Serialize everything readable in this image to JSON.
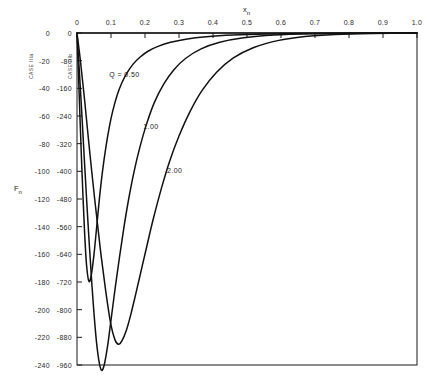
{
  "chart_data": {
    "type": "line",
    "title": "",
    "xlabel": "x_n",
    "ylabel": "F_n",
    "x_axis_position": "top",
    "xlim": [
      0,
      1.0
    ],
    "x_ticks": [
      "0",
      "0.1",
      "0.2",
      "0.3",
      "0.4",
      "0.5",
      "0.6",
      "0.7",
      "0.8",
      "0.9",
      "1.0"
    ],
    "x_tick_values": [
      0,
      0.1,
      0.2,
      0.3,
      0.4,
      0.5,
      0.6,
      0.7,
      0.8,
      0.9,
      1.0
    ],
    "grid": false,
    "legend_position": "inline-annotations",
    "axes": [
      {
        "name": "outer",
        "case_label": "CASE IIIa",
        "ylim": [
          -240,
          0
        ],
        "ticks": [
          "0",
          "-20",
          "-40",
          "-60",
          "-80",
          "-100",
          "-120",
          "-140",
          "-160",
          "-180",
          "-200",
          "-220",
          "-240"
        ],
        "tick_values": [
          0,
          -20,
          -40,
          -60,
          -80,
          -100,
          -120,
          -140,
          -160,
          -180,
          -200,
          -220,
          -240
        ]
      },
      {
        "name": "inner",
        "case_label": "CASE IIIb",
        "ylim": [
          -960,
          0
        ],
        "ticks": [
          "0",
          "-80",
          "-160",
          "-240",
          "-320",
          "-400",
          "-480",
          "-560",
          "-640",
          "-720",
          "-800",
          "-880",
          "-960"
        ],
        "tick_values": [
          0,
          -80,
          -160,
          -240,
          -320,
          -400,
          -480,
          -560,
          -640,
          -720,
          -800,
          -880,
          -960
        ]
      }
    ],
    "series": [
      {
        "name": "Q = 0.50",
        "label": "Q = 0.50",
        "q_value": 0.5,
        "minimum_x": 0.035,
        "minimum_y": -720,
        "points_x": [
          0.0,
          0.004,
          0.009,
          0.015,
          0.022,
          0.028,
          0.035,
          0.042,
          0.05,
          0.058,
          0.066,
          0.075,
          0.085,
          0.095,
          0.105,
          0.118,
          0.132,
          0.148,
          0.165,
          0.185,
          0.21,
          0.24,
          0.275,
          0.32,
          0.38,
          0.46,
          0.56,
          0.68,
          0.82,
          1.0
        ],
        "points_y": [
          0,
          -110,
          -250,
          -410,
          -570,
          -670,
          -718,
          -700,
          -640,
          -560,
          -478,
          -400,
          -330,
          -272,
          -226,
          -180,
          -144,
          -114,
          -90,
          -70,
          -52,
          -38,
          -27,
          -18,
          -11,
          -6,
          -3,
          -1.5,
          -0.6,
          0
        ]
      },
      {
        "name": "1.00",
        "label": "1.00",
        "q_value": 1.0,
        "minimum_x": 0.072,
        "minimum_y": -975,
        "points_x": [
          0.0,
          0.006,
          0.014,
          0.023,
          0.033,
          0.044,
          0.055,
          0.064,
          0.072,
          0.08,
          0.09,
          0.1,
          0.112,
          0.125,
          0.138,
          0.152,
          0.168,
          0.185,
          0.205,
          0.228,
          0.255,
          0.285,
          0.32,
          0.365,
          0.42,
          0.49,
          0.58,
          0.69,
          0.83,
          1.0
        ],
        "points_y": [
          0,
          -95,
          -230,
          -390,
          -560,
          -730,
          -870,
          -945,
          -975,
          -960,
          -905,
          -830,
          -740,
          -648,
          -562,
          -480,
          -400,
          -330,
          -262,
          -200,
          -148,
          -106,
          -73,
          -46,
          -27,
          -14,
          -6,
          -2.5,
          -0.8,
          0
        ]
      },
      {
        "name": "2.00",
        "label": "2.00",
        "q_value": 2.0,
        "minimum_x": 0.122,
        "minimum_y": -900,
        "points_x": [
          0.0,
          0.01,
          0.022,
          0.036,
          0.052,
          0.068,
          0.085,
          0.1,
          0.112,
          0.122,
          0.132,
          0.145,
          0.158,
          0.172,
          0.188,
          0.205,
          0.225,
          0.248,
          0.272,
          0.3,
          0.332,
          0.368,
          0.41,
          0.46,
          0.52,
          0.59,
          0.67,
          0.76,
          0.87,
          1.0
        ],
        "points_y": [
          0,
          -80,
          -190,
          -330,
          -480,
          -620,
          -750,
          -845,
          -888,
          -900,
          -890,
          -860,
          -815,
          -758,
          -690,
          -618,
          -535,
          -450,
          -372,
          -298,
          -228,
          -166,
          -114,
          -72,
          -42,
          -22,
          -10,
          -4,
          -1.2,
          0
        ]
      }
    ],
    "annotations": [
      {
        "text": "Q = 0.50",
        "x": 0.095,
        "y_frac": 0.115
      },
      {
        "text": "1.00",
        "x": 0.195,
        "y_frac": 0.27
      },
      {
        "text": "2.00",
        "x": 0.265,
        "y_frac": 0.405
      }
    ]
  },
  "labels": {
    "x_axis_title_main": "x",
    "x_axis_title_sub": "n",
    "y_axis_title_main": "F",
    "y_axis_title_sub": "n"
  }
}
